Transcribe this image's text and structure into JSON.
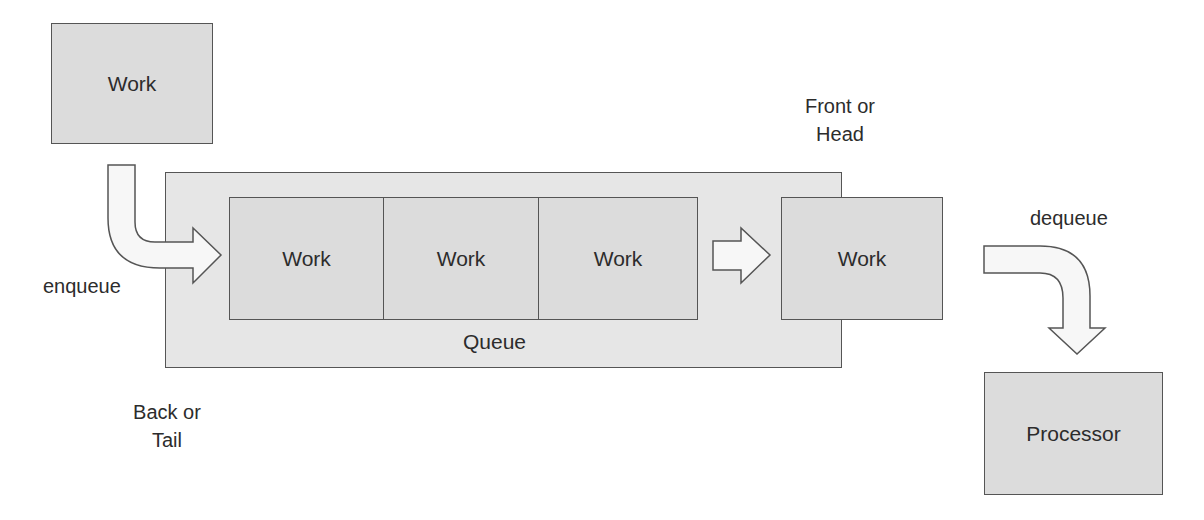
{
  "diagram": {
    "incoming_work": {
      "label": "Work"
    },
    "queue": {
      "label": "Queue",
      "items": [
        {
          "label": "Work"
        },
        {
          "label": "Work"
        },
        {
          "label": "Work"
        }
      ]
    },
    "head_work": {
      "label": "Work"
    },
    "processor": {
      "label": "Processor"
    },
    "labels": {
      "enqueue": "enqueue",
      "dequeue": "dequeue",
      "back_line1": "Back or",
      "back_line2": "Tail",
      "front_line1": "Front or",
      "front_line2": "Head"
    },
    "colors": {
      "box_fill": "#dcdcdc",
      "queue_fill": "#e6e6e6",
      "border": "#555555",
      "arrow_fill": "#f7f7f7"
    }
  }
}
